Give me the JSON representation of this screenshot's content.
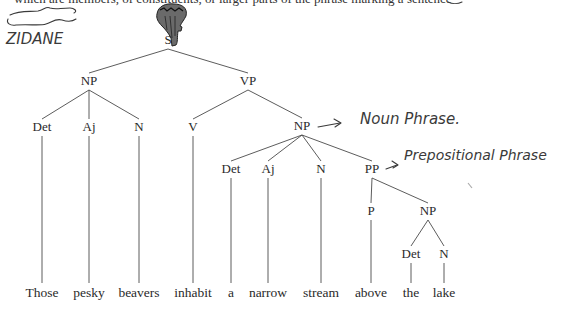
{
  "header": {
    "cut_off_text": "which are members, of constituents, or larger parts of the phrase marking a sentence"
  },
  "annotations": {
    "name_label": "ZIDANE",
    "noun_phrase_note": "Noun Phrase.",
    "prepositional_phrase_note": "Prepositional Phrase"
  },
  "tree": {
    "nodes": [
      {
        "id": "S",
        "label": "S",
        "x": 168,
        "y": 44
      },
      {
        "id": "NP1",
        "label": "NP",
        "x": 89,
        "y": 85
      },
      {
        "id": "VP",
        "label": "VP",
        "x": 248,
        "y": 85
      },
      {
        "id": "Det1",
        "label": "Det",
        "x": 42,
        "y": 131
      },
      {
        "id": "Aj1",
        "label": "Aj",
        "x": 89,
        "y": 131
      },
      {
        "id": "N1",
        "label": "N",
        "x": 139,
        "y": 131
      },
      {
        "id": "V",
        "label": "V",
        "x": 193,
        "y": 131
      },
      {
        "id": "NP2",
        "label": "NP",
        "x": 302,
        "y": 130
      },
      {
        "id": "Det2",
        "label": "Det",
        "x": 231,
        "y": 173
      },
      {
        "id": "Aj2",
        "label": "Aj",
        "x": 268,
        "y": 173
      },
      {
        "id": "N2",
        "label": "N",
        "x": 321,
        "y": 173
      },
      {
        "id": "PP",
        "label": "PP",
        "x": 372,
        "y": 173
      },
      {
        "id": "P",
        "label": "P",
        "x": 371,
        "y": 215
      },
      {
        "id": "NP3",
        "label": "NP",
        "x": 428,
        "y": 215
      },
      {
        "id": "Det3",
        "label": "Det",
        "x": 411,
        "y": 258
      },
      {
        "id": "N3",
        "label": "N",
        "x": 444,
        "y": 258
      }
    ],
    "edges": [
      [
        "S",
        "NP1"
      ],
      [
        "S",
        "VP"
      ],
      [
        "NP1",
        "Det1"
      ],
      [
        "NP1",
        "Aj1"
      ],
      [
        "NP1",
        "N1"
      ],
      [
        "VP",
        "V"
      ],
      [
        "VP",
        "NP2"
      ],
      [
        "NP2",
        "Det2"
      ],
      [
        "NP2",
        "Aj2"
      ],
      [
        "NP2",
        "N2"
      ],
      [
        "NP2",
        "PP"
      ],
      [
        "PP",
        "P"
      ],
      [
        "PP",
        "NP3"
      ],
      [
        "NP3",
        "Det3"
      ],
      [
        "NP3",
        "N3"
      ]
    ],
    "leaves": [
      {
        "word": "Those",
        "parent": "Det1",
        "x": 42
      },
      {
        "word": "pesky",
        "parent": "Aj1",
        "x": 89
      },
      {
        "word": "beavers",
        "parent": "N1",
        "x": 139
      },
      {
        "word": "inhabit",
        "parent": "V",
        "x": 193
      },
      {
        "word": "a",
        "parent": "Det2",
        "x": 231
      },
      {
        "word": "narrow",
        "parent": "Aj2",
        "x": 268
      },
      {
        "word": "stream",
        "parent": "N2",
        "x": 321
      },
      {
        "word": "above",
        "parent": "P",
        "x": 371
      },
      {
        "word": "the",
        "parent": "Det3",
        "x": 411
      },
      {
        "word": "lake",
        "parent": "N3",
        "x": 444
      }
    ],
    "leaf_baseline_y": 297
  }
}
